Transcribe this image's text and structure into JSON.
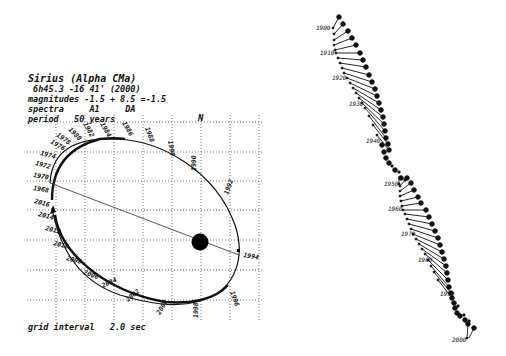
{
  "header": {
    "title": "Sirius (Alpha CMa)",
    "coords": " 6h45.3 -16 41' (2000)",
    "magnitudes": "magnitudes -1.5 + 8.5 =-1.5",
    "spectra": "spectra     A1     DA",
    "period": "period   50 years"
  },
  "footer": {
    "grid_interval": "grid interval   2.0 sec"
  },
  "orbit": {
    "north_label": "N",
    "primary_star": "Sirius A",
    "periastron_year": "1994",
    "upper_arc_labels": [
      "1968",
      "1970",
      "1972",
      "1974",
      "1976",
      "1978",
      "1980",
      "1982",
      "1984",
      "1986",
      "1988",
      "1990",
      "1992",
      "1994"
    ],
    "lower_arc_labels": [
      "2016",
      "2014",
      "2012",
      "2010",
      "2008",
      "2006",
      "2004",
      "2002",
      "2000",
      "1998",
      "1996"
    ]
  },
  "proper_motion": {
    "year_labels": [
      "1900",
      "1910",
      "1920",
      "1930",
      "1940",
      "1950",
      "1960",
      "1970",
      "1980",
      "1990",
      "2000"
    ]
  },
  "colors": {
    "ink": "#111111",
    "grid": "#555555",
    "background": "#ffffff"
  }
}
